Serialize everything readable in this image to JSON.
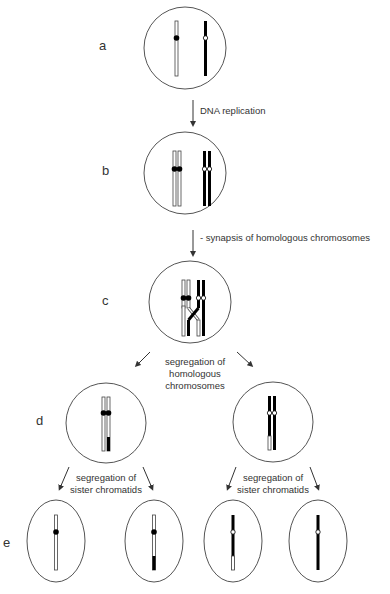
{
  "stages": [
    {
      "id": "a",
      "label": "a"
    },
    {
      "id": "b",
      "label": "b"
    },
    {
      "id": "c",
      "label": "c"
    },
    {
      "id": "d",
      "label": "d"
    },
    {
      "id": "e",
      "label": "e"
    }
  ],
  "annotations": {
    "dna_replication": "DNA replication",
    "synapsis_line1": "- synapsis of homologous chromosomes",
    "synapsis_line2": "- chiasma formation",
    "seg_homologous_line1": "segregation of",
    "seg_homologous_line2": "homologous",
    "seg_homologous_line3": "chromosomes",
    "seg_sister_left_line1": "segregation of",
    "seg_sister_left_line2": "sister chromatids",
    "seg_sister_right_line1": "segregation of",
    "seg_sister_right_line2": "sister chromatids"
  },
  "colors": {
    "maternal_chromosome": "#ffffff",
    "paternal_chromosome": "#000000",
    "cell_outline": "#555555",
    "arrow": "#333333"
  }
}
